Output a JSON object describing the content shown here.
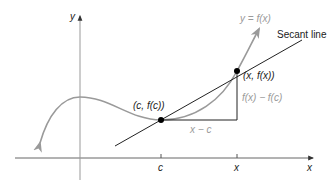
{
  "diagram": {
    "axes": {
      "x_axis_label": "x",
      "y_axis_label": "y",
      "ticks": [
        {
          "label": "c"
        },
        {
          "label": "x"
        }
      ]
    },
    "curve": {
      "label": "y = f(x)",
      "color": "#9a9a9a"
    },
    "secant": {
      "label": "Secant line",
      "color": "#222222"
    },
    "points": [
      {
        "label": "(c, f(c))"
      },
      {
        "label": "(x, f(x))"
      }
    ],
    "triangle": {
      "horizontal_label": "x − c",
      "vertical_label": "f(x) − f(c)"
    },
    "colors": {
      "axis": "#555555",
      "curve": "#9a9a9a",
      "secant": "#222222",
      "point": "#000000",
      "annotation": "#9a9a9a"
    }
  }
}
